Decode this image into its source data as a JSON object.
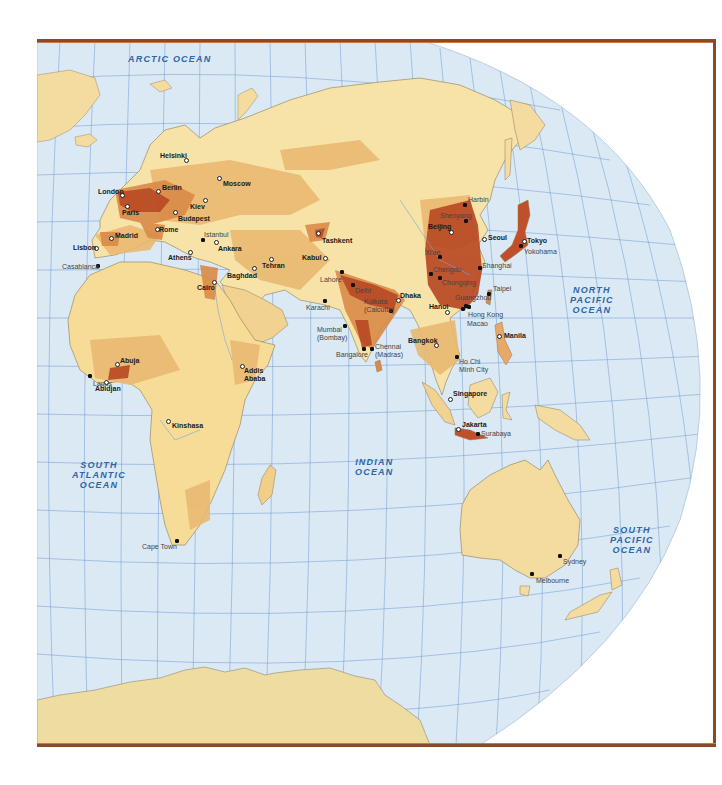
{
  "map": {
    "title": "World population density — Eastern Hemisphere",
    "colors": {
      "ocean": "#dbe9f5",
      "grid": "#4a86c6",
      "land_low": "#f7e3a8",
      "land_mid": "#eec47a",
      "land_high": "#d98a48",
      "land_very_high": "#b94a24",
      "antarctica": "#efdca0",
      "frame": "#8a4a2a",
      "ocean_label": "#2d66a8"
    },
    "oceans": [
      {
        "id": "arctic",
        "label": "ARCTIC OCEAN",
        "x": 128,
        "y": 54
      },
      {
        "id": "north-pacific",
        "label": "NORTH\nPACIFIC\nOCEAN",
        "x": 565,
        "y": 285
      },
      {
        "id": "indian",
        "label": "INDIAN\nOCEAN",
        "x": 352,
        "y": 456
      },
      {
        "id": "south-atlantic",
        "label": "SOUTH\nATLANTIC\nOCEAN",
        "x": 72,
        "y": 465
      },
      {
        "id": "south-pacific",
        "label": "SOUTH\nPACIFIC\nOCEAN",
        "x": 610,
        "y": 525
      }
    ],
    "cities": [
      {
        "name": "Helsinki",
        "type": "capital",
        "mx": 186,
        "my": 160,
        "lx": 160,
        "ly": 152
      },
      {
        "name": "Moscow",
        "type": "capital",
        "mx": 219,
        "my": 178,
        "lx": 223,
        "ly": 180
      },
      {
        "name": "London",
        "type": "capital",
        "mx": 122,
        "my": 195,
        "lx": 98,
        "ly": 188
      },
      {
        "name": "Berlin",
        "type": "capital",
        "mx": 158,
        "my": 191,
        "lx": 162,
        "ly": 184
      },
      {
        "name": "Kiev",
        "type": "capital",
        "mx": 205,
        "my": 200,
        "lx": 190,
        "ly": 203
      },
      {
        "name": "Paris",
        "type": "capital",
        "mx": 127,
        "my": 206,
        "lx": 122,
        "ly": 209
      },
      {
        "name": "Budapest",
        "type": "capital",
        "mx": 175,
        "my": 212,
        "lx": 178,
        "ly": 215
      },
      {
        "name": "Rome",
        "type": "capital",
        "mx": 157,
        "my": 229,
        "lx": 159,
        "ly": 226
      },
      {
        "name": "Madrid",
        "type": "capital",
        "mx": 111,
        "my": 238,
        "lx": 115,
        "ly": 232
      },
      {
        "name": "Lisbon",
        "type": "capital",
        "mx": 96,
        "my": 248,
        "lx": 73,
        "ly": 244
      },
      {
        "name": "Istanbul",
        "type": "other-label-grey",
        "mx": 203,
        "my": 240,
        "lx": 204,
        "ly": 231
      },
      {
        "name": "Ankara",
        "type": "capital",
        "mx": 216,
        "my": 242,
        "lx": 218,
        "ly": 245
      },
      {
        "name": "Athens",
        "type": "capital",
        "mx": 190,
        "my": 252,
        "lx": 168,
        "ly": 254
      },
      {
        "name": "Casablanca",
        "type": "other",
        "mx": 98,
        "my": 266,
        "lx": 62,
        "ly": 263
      },
      {
        "name": "Tehran",
        "type": "capital",
        "mx": 271,
        "my": 259,
        "lx": 262,
        "ly": 262
      },
      {
        "name": "Baghdad",
        "type": "capital",
        "mx": 254,
        "my": 268,
        "lx": 227,
        "ly": 272
      },
      {
        "name": "Cairo",
        "type": "capital",
        "mx": 214,
        "my": 282,
        "lx": 197,
        "ly": 284
      },
      {
        "name": "Tashkent",
        "type": "capital",
        "mx": 318,
        "my": 233,
        "lx": 322,
        "ly": 237
      },
      {
        "name": "Kabul",
        "type": "capital",
        "mx": 325,
        "my": 258,
        "lx": 302,
        "ly": 254
      },
      {
        "name": "Lahore",
        "type": "other",
        "mx": 342,
        "my": 272,
        "lx": 320,
        "ly": 276
      },
      {
        "name": "Delhi",
        "type": "other",
        "mx": 353,
        "my": 285,
        "lx": 355,
        "ly": 287
      },
      {
        "name": "Karachi",
        "type": "other",
        "mx": 325,
        "my": 301,
        "lx": 306,
        "ly": 304
      },
      {
        "name": "Kolkata\n(Calcutta)",
        "type": "other",
        "mx": 391,
        "my": 311,
        "lx": 364,
        "ly": 298
      },
      {
        "name": "Dhaka",
        "type": "capital",
        "mx": 398,
        "my": 300,
        "lx": 400,
        "ly": 292
      },
      {
        "name": "Mumbai\n(Bombay)",
        "type": "other",
        "mx": 345,
        "my": 326,
        "lx": 317,
        "ly": 326
      },
      {
        "name": "Bangalore",
        "type": "other",
        "mx": 364,
        "my": 349,
        "lx": 336,
        "ly": 351
      },
      {
        "name": "Chennai\n(Madras)",
        "type": "other",
        "mx": 372,
        "my": 349,
        "lx": 375,
        "ly": 343
      },
      {
        "name": "Harbin",
        "type": "other",
        "mx": 465,
        "my": 205,
        "lx": 468,
        "ly": 196
      },
      {
        "name": "Shenyang",
        "type": "other",
        "mx": 466,
        "my": 221,
        "lx": 440,
        "ly": 212
      },
      {
        "name": "Beijing",
        "type": "capital",
        "mx": 451,
        "my": 232,
        "lx": 428,
        "ly": 223
      },
      {
        "name": "Seoul",
        "type": "capital",
        "mx": 484,
        "my": 239,
        "lx": 488,
        "ly": 234
      },
      {
        "name": "Tokyo",
        "type": "capital",
        "mx": 524,
        "my": 241,
        "lx": 527,
        "ly": 237
      },
      {
        "name": "Yokohama",
        "type": "other",
        "mx": 521,
        "my": 246,
        "lx": 524,
        "ly": 248
      },
      {
        "name": "Xi'an",
        "type": "other",
        "mx": 440,
        "my": 257,
        "lx": 425,
        "ly": 249
      },
      {
        "name": "Shanghai",
        "type": "other",
        "mx": 480,
        "my": 268,
        "lx": 482,
        "ly": 262
      },
      {
        "name": "Chengdu",
        "type": "other",
        "mx": 431,
        "my": 274,
        "lx": 433,
        "ly": 266
      },
      {
        "name": "Chongqing",
        "type": "other",
        "mx": 440,
        "my": 278,
        "lx": 442,
        "ly": 279
      },
      {
        "name": "Guangzhou",
        "type": "other",
        "mx": 466,
        "my": 306,
        "lx": 455,
        "ly": 294
      },
      {
        "name": "Taipei",
        "type": "other",
        "mx": 489,
        "my": 294,
        "lx": 493,
        "ly": 285
      },
      {
        "name": "Hong Kong",
        "type": "other",
        "mx": 469,
        "my": 307,
        "lx": 468,
        "ly": 311
      },
      {
        "name": "Macao",
        "type": "other",
        "mx": 463,
        "my": 309,
        "lx": 467,
        "ly": 320
      },
      {
        "name": "Hanoi",
        "type": "capital",
        "mx": 447,
        "my": 312,
        "lx": 429,
        "ly": 303
      },
      {
        "name": "Manila",
        "type": "capital",
        "mx": 499,
        "my": 336,
        "lx": 504,
        "ly": 332
      },
      {
        "name": "Bangkok",
        "type": "capital",
        "mx": 436,
        "my": 345,
        "lx": 408,
        "ly": 337
      },
      {
        "name": "Ho Chi\nMinh City",
        "type": "other",
        "mx": 457,
        "my": 357,
        "lx": 459,
        "ly": 358
      },
      {
        "name": "Singapore",
        "type": "capital",
        "mx": 450,
        "my": 399,
        "lx": 453,
        "ly": 390
      },
      {
        "name": "Jakarta",
        "type": "capital",
        "mx": 458,
        "my": 429,
        "lx": 462,
        "ly": 421
      },
      {
        "name": "Surabaya",
        "type": "other",
        "mx": 478,
        "my": 434,
        "lx": 481,
        "ly": 430
      },
      {
        "name": "Abuja",
        "type": "capital",
        "mx": 117,
        "my": 364,
        "lx": 120,
        "ly": 357
      },
      {
        "name": "Lagos",
        "type": "other",
        "mx": 90,
        "my": 376,
        "lx": 93,
        "ly": 380
      },
      {
        "name": "Abidjan",
        "type": "capital",
        "mx": 106,
        "my": 382,
        "lx": 95,
        "ly": 385
      },
      {
        "name": "Addis\nAbaba",
        "type": "capital",
        "mx": 242,
        "my": 366,
        "lx": 244,
        "ly": 367
      },
      {
        "name": "Kinshasa",
        "type": "capital",
        "mx": 168,
        "my": 421,
        "lx": 172,
        "ly": 422
      },
      {
        "name": "Cape Town",
        "type": "other",
        "mx": 177,
        "my": 541,
        "lx": 142,
        "ly": 543
      },
      {
        "name": "Sydney",
        "type": "other",
        "mx": 560,
        "my": 556,
        "lx": 563,
        "ly": 558
      },
      {
        "name": "Melbourne",
        "type": "other",
        "mx": 532,
        "my": 574,
        "lx": 536,
        "ly": 577
      }
    ]
  }
}
